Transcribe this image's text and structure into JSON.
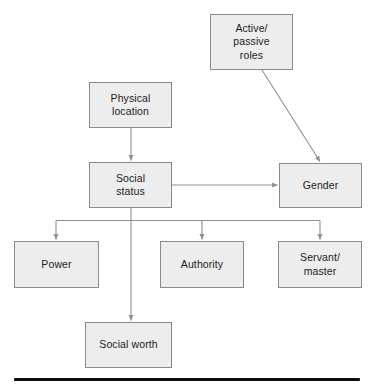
{
  "diagram": {
    "style": {
      "node_fill": "#ededed",
      "node_border": "#8a8a8a",
      "edge_color": "#8f8f8f",
      "text_color": "#1c1c1c",
      "background": "#ffffff",
      "rule_color": "#0d0d0d"
    },
    "nodes": [
      {
        "id": "active-passive-roles",
        "label": "Active/\npassive\nroles",
        "x": 210,
        "y": 14,
        "w": 83,
        "h": 56
      },
      {
        "id": "physical-location",
        "label": "Physical\nlocation",
        "x": 89,
        "y": 82,
        "w": 83,
        "h": 46
      },
      {
        "id": "social-status",
        "label": "Social\nstatus",
        "x": 89,
        "y": 162,
        "w": 83,
        "h": 46
      },
      {
        "id": "gender",
        "label": "Gender",
        "x": 279,
        "y": 163,
        "w": 83,
        "h": 45
      },
      {
        "id": "power",
        "label": "Power",
        "x": 14,
        "y": 241,
        "w": 85,
        "h": 47
      },
      {
        "id": "authority",
        "label": "Authority",
        "x": 160,
        "y": 241,
        "w": 84,
        "h": 47
      },
      {
        "id": "servant-master",
        "label": "Servant/\nmaster",
        "x": 278,
        "y": 241,
        "w": 84,
        "h": 47
      },
      {
        "id": "social-worth",
        "label": "Social worth",
        "x": 85,
        "y": 322,
        "w": 87,
        "h": 46
      }
    ],
    "edges": [
      {
        "id": "physical-location-to-social-status",
        "from": "physical-location",
        "to": "social-status",
        "kind": "vertical-arrow"
      },
      {
        "id": "active-passive-roles-to-gender",
        "from": "active-passive-roles",
        "to": "gender",
        "kind": "diagonal-arrow"
      },
      {
        "id": "social-status-to-gender",
        "from": "social-status",
        "to": "gender",
        "kind": "horizontal-arrow"
      },
      {
        "id": "social-status-to-power",
        "from": "social-status",
        "to": "power",
        "kind": "elbow-arrow"
      },
      {
        "id": "social-status-to-authority",
        "from": "social-status",
        "to": "authority",
        "kind": "elbow-arrow"
      },
      {
        "id": "social-status-to-servant-master",
        "from": "social-status",
        "to": "servant-master",
        "kind": "elbow-arrow"
      },
      {
        "id": "social-status-to-social-worth",
        "from": "social-status",
        "to": "social-worth",
        "kind": "vertical-arrow"
      }
    ],
    "bottom_rule": {
      "x": 14,
      "y": 378,
      "w": 346,
      "h": 3
    }
  }
}
